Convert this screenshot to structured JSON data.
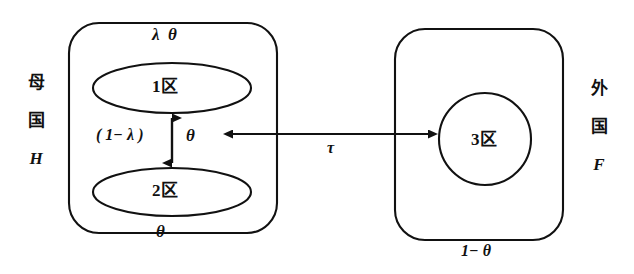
{
  "diagram": {
    "type": "two-country-three-region schematic",
    "background_color": "#ffffff",
    "stroke_color": "#111111"
  },
  "home_country": {
    "side_label_char1": "母",
    "side_label_char2": "国",
    "side_label_symbol": "H",
    "top_caption": "λ  θ",
    "bottom_caption": "θ",
    "regions": [
      {
        "id": "region-1",
        "label": "1区",
        "shape": "ellipse"
      },
      {
        "id": "region-2",
        "label": "2区",
        "shape": "ellipse"
      }
    ],
    "internal_flow": {
      "label_left": "( 1− λ )",
      "label_right": "θ",
      "arrow": "double-headed-vertical"
    }
  },
  "foreign_country": {
    "side_label_char1": "外",
    "side_label_char2": "国",
    "side_label_symbol": "F",
    "bottom_caption": "1− θ",
    "regions": [
      {
        "id": "region-3",
        "label": "3区",
        "shape": "circle"
      }
    ]
  },
  "cross_border_flow": {
    "label": "τ",
    "arrow": "double-headed-horizontal"
  }
}
